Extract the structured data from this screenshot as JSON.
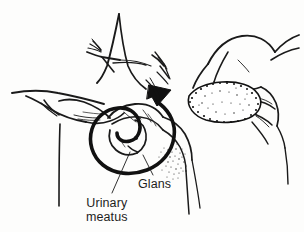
{
  "figure": {
    "background_color": "#fdfdfc",
    "ink_color": "#1a1a1a",
    "style": "black-and-white line drawing"
  },
  "labels": {
    "glans": "Glans",
    "urinary_meatus_line1": "Urinary",
    "urinary_meatus_line2": "meatus"
  },
  "annotations": {
    "arrow": "curved-retraction-arrow",
    "leader_line_glans": "leader-line",
    "leader_line_meatus": "leader-line"
  },
  "elements": {
    "left_hand": "left-hand-retracting",
    "right_hand": "right-hand-holding-swab",
    "swab": "gauze-swab",
    "glans_region": "glans-penis",
    "shaft": "penile-shaft"
  }
}
